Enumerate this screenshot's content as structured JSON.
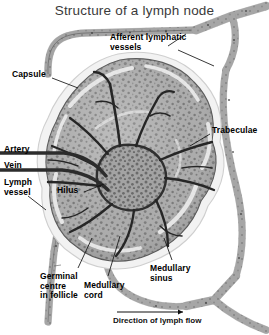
{
  "figure": {
    "title": "Structure of a lymph node",
    "type": "anatomical-illustration",
    "style": "grayscale halftone drawing",
    "background_color": "#ffffff",
    "ink_color": "#000000"
  },
  "labels": [
    {
      "id": "afferent",
      "text": "Afferent lymphatic\nvessels",
      "x": 110,
      "y": 33,
      "align": "left"
    },
    {
      "id": "capsule",
      "text": "Capsule",
      "x": 12,
      "y": 70,
      "align": "left"
    },
    {
      "id": "trabeculae",
      "text": "Trabeculae",
      "x": 212,
      "y": 126,
      "align": "left"
    },
    {
      "id": "artery",
      "text": "Artery",
      "x": 4,
      "y": 145,
      "align": "left"
    },
    {
      "id": "vein",
      "text": "Vein",
      "x": 4,
      "y": 161,
      "align": "left"
    },
    {
      "id": "lymph",
      "text": "Lymph\nvessel",
      "x": 4,
      "y": 178,
      "align": "left"
    },
    {
      "id": "hilus",
      "text": "Hilus",
      "x": 57,
      "y": 186,
      "align": "left"
    },
    {
      "id": "germinal",
      "text": "Germinal\ncentre\nin follicle",
      "x": 40,
      "y": 272,
      "align": "left"
    },
    {
      "id": "medcord",
      "text": "Medullary\ncord",
      "x": 84,
      "y": 281,
      "align": "left"
    },
    {
      "id": "medsinus",
      "text": "Medullary\nsinus",
      "x": 150,
      "y": 264,
      "align": "left"
    }
  ],
  "flow": {
    "caption": "Direction of lymph flow",
    "caption_x": 113,
    "caption_y": 321,
    "arrow_from_x": 117,
    "arrow_to_x": 186,
    "arrow_y": 312
  },
  "colors": {
    "cortex_fill": "#a9a9a9",
    "cortex_dots": "#6f6f6f",
    "capsule_edge": "#efefef",
    "trabecula": "#2b2b2b",
    "vessel_fill": "#b4b4b4",
    "vessel_edge": "#5a5a5a",
    "title_text": "#3a3a3a",
    "label_text": "#000000",
    "leader_line": "#1a1a1a"
  }
}
